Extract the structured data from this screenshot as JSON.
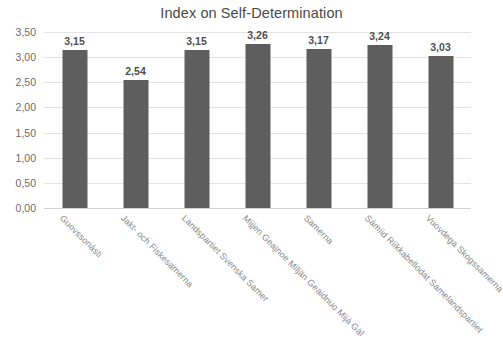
{
  "chart_data": {
    "type": "bar",
    "title": "Index on Self-Determination",
    "xlabel": "",
    "ylabel": "",
    "ylim": [
      0,
      3.5
    ],
    "ytick_step": 0.5,
    "decimal_separator": ",",
    "grid": true,
    "legend": "none",
    "bar_color": "#5e5e5e",
    "gridline_color": "#e3e3e3",
    "categories": [
      "Guovssonásti",
      "Jakt- och Fiskesamerna",
      "Landspartiet Svenska Samer",
      "Mijjen Geajnoe Miljän Geaidnuo Mijá Gäl",
      "Samerna",
      "Sámiid Riikkabellodat Samelandspartiet",
      "Vuovdega Skogssamerna"
    ],
    "values": [
      3.15,
      2.54,
      3.15,
      3.26,
      3.17,
      3.24,
      3.03
    ],
    "value_labels": [
      "3,15",
      "2,54",
      "3,15",
      "3,26",
      "3,17",
      "3,24",
      "3,03"
    ],
    "ytick_labels": [
      "0,00",
      "0,50",
      "1,00",
      "1,50",
      "2,00",
      "2,50",
      "3,00",
      "3,50"
    ],
    "ytick_values": [
      0,
      0.5,
      1,
      1.5,
      2,
      2.5,
      3,
      3.5
    ]
  }
}
